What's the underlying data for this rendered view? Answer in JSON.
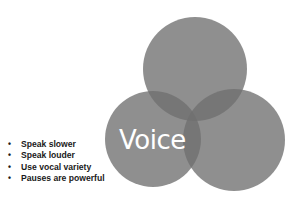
{
  "diagram": {
    "type": "venn",
    "center_label": "Voice",
    "circle_color": "#7a7a7a",
    "circles": [
      {
        "name": "top",
        "cx": 195,
        "cy": 69,
        "r": 52
      },
      {
        "name": "left",
        "cx": 153,
        "cy": 139,
        "r": 48
      },
      {
        "name": "right",
        "cx": 234,
        "cy": 140,
        "r": 51
      }
    ]
  },
  "bullets": {
    "marker": "•",
    "items": [
      "Speak slower",
      "Speak louder",
      "Use vocal variety",
      "Pauses are powerful"
    ]
  }
}
